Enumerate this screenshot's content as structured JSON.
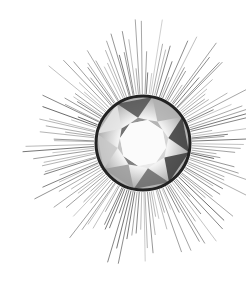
{
  "illustration": {
    "subject": "Round brilliant-cut diamond with radiating sunburst lines",
    "style": "grayscale engraving",
    "background": "#ffffff",
    "center": [
      143,
      143
    ],
    "gem_radius": 47,
    "rim_color": "#222222",
    "ray_color": "#555555",
    "ray_count": 150,
    "ray_inner_radius": 49,
    "ray_outer_radius_range": [
      70,
      125
    ]
  }
}
